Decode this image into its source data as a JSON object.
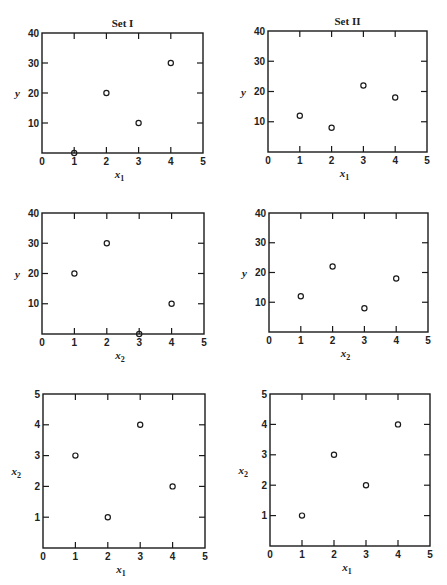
{
  "figure": {
    "columns": [
      "Set I",
      "Set II"
    ]
  },
  "chart_data": [
    {
      "id": "set1-y-vs-x1",
      "type": "scatter",
      "title": "Set I",
      "xlabel": "x",
      "xlabel_sub": "1",
      "ylabel": "y",
      "ylabel_sub": "",
      "xlim": [
        0,
        5
      ],
      "ylim": [
        0,
        40
      ],
      "xticks": [
        0,
        1,
        2,
        3,
        4,
        5
      ],
      "yticks": [
        10,
        20,
        30,
        40
      ],
      "ytick_labels_top": "40",
      "grid": false,
      "points": [
        {
          "x": 1,
          "y": 0
        },
        {
          "x": 2,
          "y": 20
        },
        {
          "x": 3,
          "y": 10
        },
        {
          "x": 4,
          "y": 30
        }
      ],
      "frame": {
        "left": 42,
        "top": 33,
        "right": 203,
        "bottom": 153
      }
    },
    {
      "id": "set2-y-vs-x1",
      "type": "scatter",
      "title": "Set II",
      "xlabel": "x",
      "xlabel_sub": "1",
      "ylabel": "y",
      "ylabel_sub": "",
      "xlim": [
        0,
        5
      ],
      "ylim": [
        0,
        40
      ],
      "xticks": [
        0,
        1,
        2,
        3,
        4,
        5
      ],
      "yticks": [
        10,
        20,
        30,
        40
      ],
      "grid": false,
      "points": [
        {
          "x": 1,
          "y": 12
        },
        {
          "x": 2,
          "y": 8
        },
        {
          "x": 3,
          "y": 22
        },
        {
          "x": 4,
          "y": 18
        }
      ],
      "frame": {
        "left": 268,
        "top": 31,
        "right": 427,
        "bottom": 152
      }
    },
    {
      "id": "set1-y-vs-x2",
      "type": "scatter",
      "title": "",
      "xlabel": "x",
      "xlabel_sub": "2",
      "ylabel": "y",
      "ylabel_sub": "",
      "xlim": [
        0,
        5
      ],
      "ylim": [
        0,
        40
      ],
      "xticks": [
        0,
        1,
        2,
        3,
        4,
        5
      ],
      "yticks": [
        10,
        20,
        30,
        40
      ],
      "grid": false,
      "points": [
        {
          "x": 1,
          "y": 20
        },
        {
          "x": 2,
          "y": 30
        },
        {
          "x": 3,
          "y": 0
        },
        {
          "x": 4,
          "y": 10
        }
      ],
      "frame": {
        "left": 42,
        "top": 213,
        "right": 204,
        "bottom": 334
      }
    },
    {
      "id": "set2-y-vs-x2",
      "type": "scatter",
      "title": "",
      "xlabel": "x",
      "xlabel_sub": "2",
      "ylabel": "y",
      "ylabel_sub": "",
      "xlim": [
        0,
        5
      ],
      "ylim": [
        0,
        40
      ],
      "xticks": [
        0,
        1,
        2,
        3,
        4,
        5
      ],
      "yticks": [
        10,
        20,
        30,
        40
      ],
      "grid": false,
      "points": [
        {
          "x": 1,
          "y": 12
        },
        {
          "x": 2,
          "y": 22
        },
        {
          "x": 3,
          "y": 8
        },
        {
          "x": 4,
          "y": 18
        }
      ],
      "frame": {
        "left": 269,
        "top": 213,
        "right": 428,
        "bottom": 332
      }
    },
    {
      "id": "set1-x2-vs-x1",
      "type": "scatter",
      "title": "",
      "xlabel": "x",
      "xlabel_sub": "1",
      "ylabel": "x",
      "ylabel_sub": "2",
      "xlim": [
        0,
        5
      ],
      "ylim": [
        0,
        5
      ],
      "xticks": [
        0,
        1,
        2,
        3,
        4,
        5
      ],
      "yticks": [
        1,
        2,
        3,
        4,
        5
      ],
      "grid": false,
      "points": [
        {
          "x": 1,
          "y": 3
        },
        {
          "x": 2,
          "y": 1
        },
        {
          "x": 3,
          "y": 4
        },
        {
          "x": 4,
          "y": 2
        }
      ],
      "frame": {
        "left": 43,
        "top": 394,
        "right": 205,
        "bottom": 548
      }
    },
    {
      "id": "set2-x2-vs-x1",
      "type": "scatter",
      "title": "",
      "xlabel": "x",
      "xlabel_sub": "1",
      "ylabel": "x",
      "ylabel_sub": "2",
      "xlim": [
        0,
        5
      ],
      "ylim": [
        0,
        5
      ],
      "xticks": [
        0,
        1,
        2,
        3,
        4,
        5
      ],
      "yticks": [
        1,
        2,
        3,
        4,
        5
      ],
      "grid": false,
      "points": [
        {
          "x": 1,
          "y": 1
        },
        {
          "x": 2,
          "y": 3
        },
        {
          "x": 3,
          "y": 2
        },
        {
          "x": 4,
          "y": 4
        }
      ],
      "frame": {
        "left": 270,
        "top": 394,
        "right": 430,
        "bottom": 546
      }
    }
  ]
}
